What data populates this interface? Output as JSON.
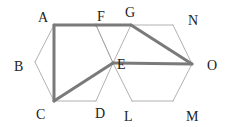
{
  "diagram": {
    "type": "hexagon-grid-path",
    "colors": {
      "background": "#ffffff",
      "thin_line": "#a8a8a8",
      "thick_line": "#7a7a7a",
      "label": "#222222"
    },
    "points": {
      "A": {
        "x": 54,
        "y": 25
      },
      "F": {
        "x": 96,
        "y": 25
      },
      "G": {
        "x": 131,
        "y": 25
      },
      "N": {
        "x": 173,
        "y": 25
      },
      "B": {
        "x": 35,
        "y": 62
      },
      "E": {
        "x": 113,
        "y": 63
      },
      "O": {
        "x": 192,
        "y": 64
      },
      "C": {
        "x": 54,
        "y": 101
      },
      "D": {
        "x": 96,
        "y": 101
      },
      "L": {
        "x": 132,
        "y": 101
      },
      "M": {
        "x": 173,
        "y": 101
      }
    },
    "labels": [
      {
        "text": "A",
        "x": 38,
        "y": 22
      },
      {
        "text": "F",
        "x": 97,
        "y": 21
      },
      {
        "text": "G",
        "x": 125,
        "y": 17
      },
      {
        "text": "N",
        "x": 188,
        "y": 25
      },
      {
        "text": "B",
        "x": 14,
        "y": 71
      },
      {
        "text": "E",
        "x": 117,
        "y": 69
      },
      {
        "text": "O",
        "x": 207,
        "y": 70
      },
      {
        "text": "C",
        "x": 36,
        "y": 119
      },
      {
        "text": "D",
        "x": 95,
        "y": 118
      },
      {
        "text": "L",
        "x": 124,
        "y": 121
      },
      {
        "text": "M",
        "x": 186,
        "y": 121
      }
    ],
    "thin_edges": [
      [
        "A",
        "B"
      ],
      [
        "B",
        "C"
      ],
      [
        "C",
        "D"
      ],
      [
        "D",
        "E"
      ],
      [
        "E",
        "F"
      ],
      [
        "F",
        "A"
      ],
      [
        "F",
        "E"
      ],
      [
        "G",
        "N"
      ],
      [
        "N",
        "O"
      ],
      [
        "O",
        "M"
      ],
      [
        "M",
        "L"
      ],
      [
        "L",
        "E"
      ],
      [
        "E",
        "G"
      ]
    ],
    "thick_path": [
      [
        "A",
        "F"
      ],
      [
        "F",
        "G"
      ],
      [
        "G",
        "O"
      ],
      [
        "O",
        "E"
      ],
      [
        "E",
        "C"
      ],
      [
        "C",
        "A"
      ]
    ]
  }
}
